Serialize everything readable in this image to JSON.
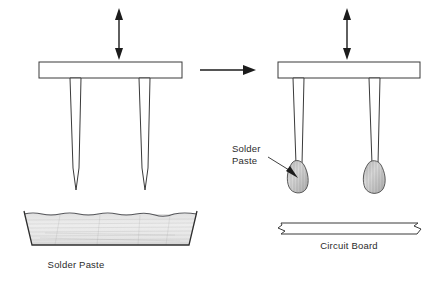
{
  "figure": {
    "background_color": "#ffffff",
    "ink_color": "#2b2b2b",
    "paste_fill_color": "#e8e8e8",
    "width": 440,
    "height": 283
  },
  "labels": {
    "solder_paste_tray": "Solder Paste",
    "solder_paste_callout_line1": "Solder",
    "solder_paste_callout_line2": "Paste",
    "circuit_board": "Circuit Board"
  },
  "stages": [
    {
      "id": "stage-left",
      "name": "pin-dip-into-paste",
      "tool_label": "pin transfer head",
      "vertical_arrow": "up-down-motion",
      "vessel": "solder paste tray",
      "vessel_label": "Solder Paste",
      "pin_count": 2
    },
    {
      "id": "stage-right",
      "name": "pins-deposit-paste-on-board",
      "tool_label": "pin transfer head",
      "vertical_arrow": "up-down-motion",
      "substrate": "circuit board",
      "substrate_label": "Circuit Board",
      "deposit_label": "Solder Paste",
      "pin_count": 2
    }
  ],
  "annotations": {
    "process_arrow": "right-arrow",
    "process_arrow_direction": "left-to-right",
    "motion_arrows": "double-headed-vertical"
  }
}
